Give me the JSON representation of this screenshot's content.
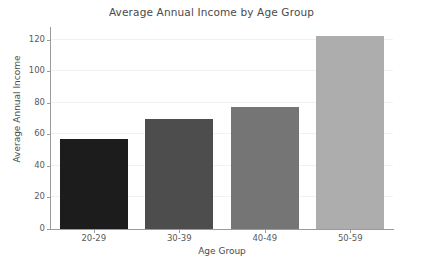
{
  "chart_data": {
    "type": "bar",
    "title": "Average Annual Income by Age Group",
    "xlabel": "Age Group",
    "ylabel": "Average Annual Income",
    "categories": [
      "20-29",
      "30-39",
      "40-49",
      "50-59"
    ],
    "values": [
      57,
      70,
      77,
      122
    ],
    "bar_colors": [
      "#1c1c1c",
      "#4d4d4d",
      "#757575",
      "#adadad"
    ],
    "ylim": [
      0,
      128
    ],
    "yticks": [
      0,
      20,
      40,
      60,
      80,
      100,
      120
    ],
    "ytick_labels": [
      "0",
      "20",
      "40",
      "60",
      "80",
      "100",
      "120"
    ],
    "grid": true,
    "grid_axis": "y",
    "grid_color": "#f2f2f3",
    "legend": null,
    "background_color": "#ffffff",
    "axis_color": "#9a9a9a",
    "text_color": "#4a4a4a"
  }
}
